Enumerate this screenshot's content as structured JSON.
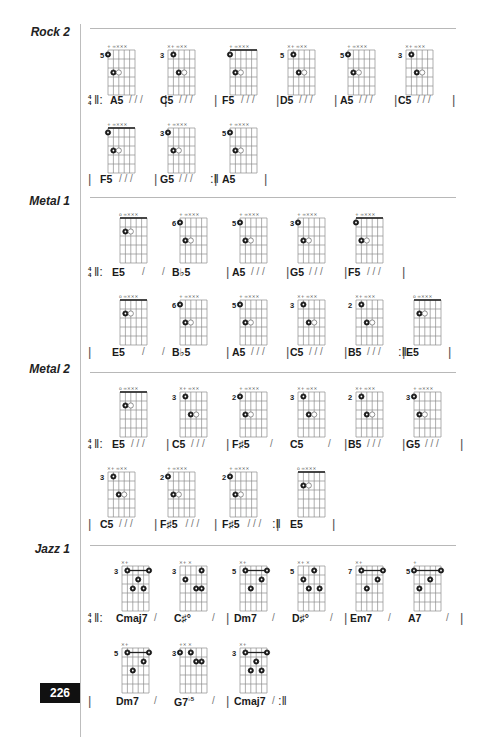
{
  "page": {
    "number": "226",
    "colors": {
      "ink": "#1a1a1a",
      "grid": "#8c8c8c",
      "rule": "#b8b8b8",
      "page_box": "#111111"
    }
  },
  "sections": [
    {
      "title": "Rock 2",
      "rows": [
        {
          "diagrams": [
            {
              "fret": "5",
              "open_marks": "+  ∞××× "
            },
            {
              "fret": "3",
              "open_marks": "×+ ∞×× "
            },
            {
              "fret": "",
              "open_marks": "+  ∞××× ",
              "barre": true
            },
            {
              "fret": "5",
              "open_marks": "×+ ∞×× "
            },
            {
              "fret": "5",
              "open_marks": "+  ∞××× "
            },
            {
              "fret": "3",
              "open_marks": "×+ ∞×× "
            }
          ],
          "chords": [
            "A5",
            "C5",
            "F5",
            "D5",
            "A5",
            "C5"
          ],
          "strum": "/ / /",
          "start": "4/4 |:",
          "end": "|"
        },
        {
          "diagrams": [
            {
              "fret": "",
              "open_marks": "+  ∞××× ",
              "barre": true
            },
            {
              "fret": "3",
              "open_marks": "+  ∞××× "
            },
            {
              "fret": "5",
              "open_marks": "+  ∞××× "
            }
          ],
          "chords": [
            "F5",
            "G5",
            "A5"
          ],
          "strum": "/ / /",
          "end": ":|  |"
        }
      ]
    },
    {
      "title": "Metal 1",
      "rows": [
        {
          "diagrams": [
            {
              "fret": "",
              "open_marks": "o ∞×××",
              "barre": true
            },
            {
              "fret": "6",
              "open_marks": "+  ∞××× "
            },
            {
              "fret": "5",
              "open_marks": "+  ∞××× "
            },
            {
              "fret": "3",
              "open_marks": "+  ∞××× "
            },
            {
              "fret": "",
              "open_marks": "+  ∞××× ",
              "barre": true
            }
          ],
          "chords": [
            "E5",
            "B♭5",
            "A5",
            "G5",
            "F5"
          ],
          "strum_split": "/   /",
          "strum": "/ / /",
          "start": "4/4 |:"
        },
        {
          "diagrams": [
            {
              "fret": "",
              "open_marks": "o ∞×××",
              "barre": true
            },
            {
              "fret": "6",
              "open_marks": "+  ∞××× "
            },
            {
              "fret": "5",
              "open_marks": "+  ∞××× "
            },
            {
              "fret": "3",
              "open_marks": "×+ ∞×× "
            },
            {
              "fret": "2",
              "open_marks": "×+ ∞×× "
            },
            {
              "fret": "",
              "open_marks": "o ∞×××",
              "barre": true
            }
          ],
          "chords": [
            "E5",
            "B♭5",
            "A5",
            "C5",
            "B5",
            "E5"
          ],
          "strum": "/ / /"
        }
      ]
    },
    {
      "title": "Metal 2",
      "rows": [
        {
          "diagrams": [
            {
              "fret": "",
              "open_marks": "o ∞×××",
              "barre": true
            },
            {
              "fret": "3",
              "open_marks": "×+ ∞×× "
            },
            {
              "fret": "2",
              "open_marks": "+  ∞××× "
            },
            {
              "fret": "3",
              "open_marks": "×+ ∞×× "
            },
            {
              "fret": "2",
              "open_marks": "×+ ∞×× "
            },
            {
              "fret": "3",
              "open_marks": "+  ∞××× "
            }
          ],
          "chords": [
            "E5",
            "C5",
            "F♯5",
            "C5",
            "B5",
            "G5"
          ],
          "strum": "/ / /",
          "start": "4/4 |:"
        },
        {
          "diagrams": [
            {
              "fret": "3",
              "open_marks": "×+ ∞×× "
            },
            {
              "fret": "2",
              "open_marks": "+  ∞××× "
            },
            {
              "fret": "2",
              "open_marks": "+  ∞××× "
            },
            {
              "fret": "",
              "open_marks": "o ∞×××",
              "barre": true
            }
          ],
          "chords": [
            "C5",
            "F♯5",
            "F♯5",
            "E5"
          ],
          "strum": "/ / /"
        }
      ]
    },
    {
      "title": "Jazz 1",
      "rows": [
        {
          "diagrams": [
            {
              "fret": "3",
              "open_marks": "×+"
            },
            {
              "fret": "3",
              "open_marks": "×+   ×"
            },
            {
              "fret": "5",
              "open_marks": "×+"
            },
            {
              "fret": "5",
              "open_marks": "×+   ×"
            },
            {
              "fret": "7",
              "open_marks": "×+"
            },
            {
              "fret": "5",
              "open_marks": "+"
            }
          ],
          "chords": [
            "Cmaj7",
            "C♯°",
            "Dm7",
            "D♯°",
            "Em7",
            "A7"
          ],
          "strum": "/",
          "start": "4/4 |:"
        },
        {
          "diagrams": [
            {
              "fret": "5",
              "open_marks": "×+"
            },
            {
              "fret": "3",
              "open_marks": "+×   ×"
            },
            {
              "fret": "3",
              "open_marks": "×+"
            }
          ],
          "chords": [
            "Dm7",
            "G7♭5",
            "Cmaj7"
          ],
          "chord_g7_base": "G7",
          "chord_g7_sup": "♭5",
          "strum": "/"
        }
      ]
    }
  ],
  "labels": {
    "time_top": "4",
    "time_bottom": "4",
    "repeat_start": "‖:",
    "repeat_end": ":‖",
    "bar": "|",
    "slash": "/",
    "slashes3": "/ / /"
  }
}
